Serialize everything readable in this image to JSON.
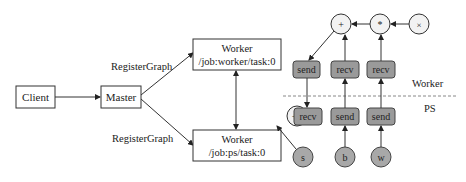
{
  "diagram": {
    "nodes": {
      "client": "Client",
      "master": "Master",
      "worker_top_line1": "Worker",
      "worker_top_line2": "/job:worker/task:0",
      "worker_bottom_line1": "Worker",
      "worker_bottom_line2": "/job:ps/task:0"
    },
    "edges": {
      "register_top": "RegisterGraph",
      "register_bottom": "RegisterGraph"
    },
    "ops_worker": {
      "add": "+",
      "mul": "*",
      "x": "×",
      "send": "send",
      "recv1": "recv",
      "recv2": "recv"
    },
    "ops_ps": {
      "assign_add": "+=",
      "recv": "recv",
      "send1": "send",
      "send2": "send",
      "s": "s",
      "b": "b",
      "w": "w"
    },
    "regions": {
      "worker": "Worker",
      "ps": "PS"
    },
    "colors": {
      "op_fill": "#9a9a9a",
      "var_fill": "#a8a8a8",
      "circle_fill": "#f2f2f2",
      "stroke": "#333333"
    }
  }
}
